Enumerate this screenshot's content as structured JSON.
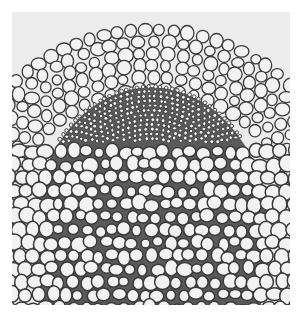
{
  "image": {
    "subject": "plant vascular tissue cross-section micrograph",
    "style": "grayscale",
    "colors": {
      "background": "#ffffff",
      "field": "#e9e9e9",
      "cell_wall": "#3a3a3a",
      "cell_lumen": "#f2f2f2",
      "dense_region": "#5a5a5a"
    }
  }
}
